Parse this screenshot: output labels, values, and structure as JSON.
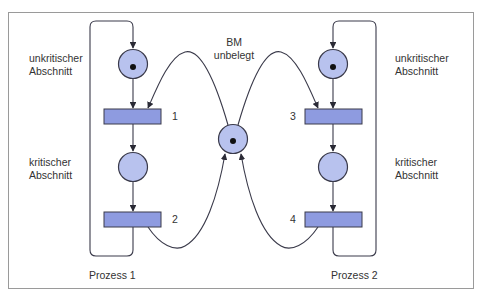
{
  "diagram": {
    "type": "petri-net",
    "colors": {
      "frame": "#9a9a9a",
      "place_fill": "#b8c2ee",
      "transition_fill": "#8e9be0",
      "stroke": "#3a3a4a",
      "token": "#111111",
      "text": "#333333"
    },
    "processes": [
      {
        "label": "Prozess 1",
        "places": [
          {
            "id": "p1_uncrit",
            "label_line1": "unkritischer",
            "label_line2": "Abschnitt",
            "tokens": 1
          },
          {
            "id": "p1_crit",
            "label_line1": "kritischer",
            "label_line2": "Abschnitt",
            "tokens": 0
          }
        ],
        "transitions": [
          {
            "id": "t1",
            "number": "1"
          },
          {
            "id": "t2",
            "number": "2"
          }
        ]
      },
      {
        "label": "Prozess 2",
        "places": [
          {
            "id": "p2_uncrit",
            "label_line1": "unkritischer",
            "label_line2": "Abschnitt",
            "tokens": 1
          },
          {
            "id": "p2_crit",
            "label_line1": "kritischer",
            "label_line2": "Abschnitt",
            "tokens": 0
          }
        ],
        "transitions": [
          {
            "id": "t3",
            "number": "3"
          },
          {
            "id": "t4",
            "number": "4"
          }
        ]
      }
    ],
    "shared_place": {
      "id": "bm",
      "label_line1": "BM",
      "label_line2": "unbelegt",
      "tokens": 1
    },
    "arcs": [
      [
        "p1_uncrit",
        "t1"
      ],
      [
        "t1",
        "p1_crit"
      ],
      [
        "p1_crit",
        "t2"
      ],
      [
        "t2",
        "p1_uncrit"
      ],
      [
        "p2_uncrit",
        "t3"
      ],
      [
        "t3",
        "p2_crit"
      ],
      [
        "p2_crit",
        "t4"
      ],
      [
        "t4",
        "p2_uncrit"
      ],
      [
        "bm",
        "t1"
      ],
      [
        "t2",
        "bm"
      ],
      [
        "bm",
        "t3"
      ],
      [
        "t4",
        "bm"
      ]
    ]
  }
}
